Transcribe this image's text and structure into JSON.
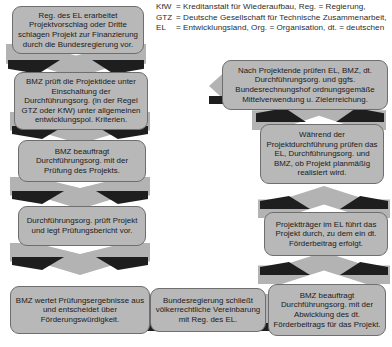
{
  "diagram": {
    "accent_color": "#b8b8b8",
    "line_color": "#1e1e1e"
  },
  "legend": {
    "rows": [
      {
        "key": "KfW",
        "eq": "=",
        "value": "Kreditanstalt für Wiederaufbau, Reg. = Regierung,"
      },
      {
        "key": "GTZ",
        "eq": "=",
        "value": "Deutsche Gesellschaft für Technische Zusammenarbeit,"
      },
      {
        "key": "EL",
        "eq": "=",
        "value": "Entwicklungsland, Org. = Organisation, dt. = deutschen"
      }
    ]
  },
  "nodes": [
    {
      "id": "n1",
      "text": "Reg. des EL erarbeitet Projektvorschlag oder Dritte schlagen Projekt zur Finanzierung durch die Bundesregierung vor."
    },
    {
      "id": "n2",
      "text": "BMZ prüft die Projektidee unter Einschaltung der Durchführungsorg. (in der Regel GTZ oder KfW) unter allgemeinen entwicklungspol. Kriterien."
    },
    {
      "id": "n3",
      "text": "BMZ beauftragt Durchführungsorg. mit der Prüfung des Projekts."
    },
    {
      "id": "n4",
      "text": "Durchführungsorg. prüft Projekt und legt Prüfungsbericht vor."
    },
    {
      "id": "n5",
      "text": "BMZ wertet Prüfungsergebnisse aus und entscheidet über Förderungswürdigkeit."
    },
    {
      "id": "n6",
      "text": "Bundesregierung schließt völkerrechtliche Vereinbarung mit Reg. des EL."
    },
    {
      "id": "n7",
      "text": "BMZ beauftragt Durchführungsorg. mit der Abwicklung des dt. Förderbeitrags für das Projekt."
    },
    {
      "id": "n8",
      "text": "Projektträger im EL führt das Projekt durch, zu dem ein dt. Förderbeitrag erfolgt."
    },
    {
      "id": "n9",
      "text": "Während der Projektdurchführung prüfen das EL, Durchführungsorg. und BMZ, ob Projekt planmäßig realisiert wird."
    },
    {
      "id": "n10",
      "text": "Nach Projektende prüfen EL, BMZ, dt. Durchführungsorg. und ggfs. Bundesrechnungshof ordnungsgemäße Mittelverwendung u. Zielerreichung."
    }
  ]
}
